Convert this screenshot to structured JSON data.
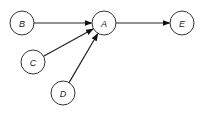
{
  "diagram": {
    "type": "directed-graph",
    "nodes": [
      {
        "id": "A",
        "label": "A",
        "cx": 104,
        "cy": 23,
        "r": 12
      },
      {
        "id": "B",
        "label": "B",
        "cx": 22,
        "cy": 23,
        "r": 12
      },
      {
        "id": "C",
        "label": "C",
        "cx": 33,
        "cy": 62,
        "r": 12
      },
      {
        "id": "D",
        "label": "D",
        "cx": 63,
        "cy": 93,
        "r": 12
      },
      {
        "id": "E",
        "label": "E",
        "cx": 182,
        "cy": 23,
        "r": 12
      }
    ],
    "edges": [
      {
        "from": "B",
        "to": "A"
      },
      {
        "from": "C",
        "to": "A"
      },
      {
        "from": "D",
        "to": "A"
      },
      {
        "from": "A",
        "to": "E"
      }
    ],
    "colors": {
      "stroke": "#333333",
      "edge": "#222222",
      "fill": "#ffffff"
    }
  }
}
